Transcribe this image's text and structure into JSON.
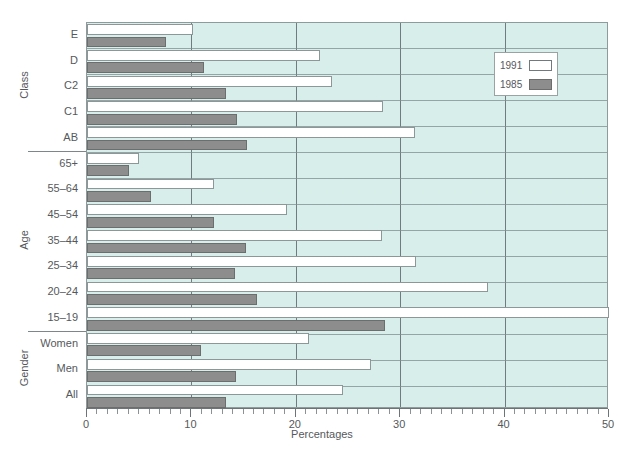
{
  "chart_data": {
    "type": "bar",
    "orientation": "horizontal",
    "title": "",
    "xlabel": "Percentages",
    "ylabel": "",
    "xlim": [
      0,
      50
    ],
    "xticks": [
      0,
      10,
      20,
      30,
      40,
      50
    ],
    "xtick_labels": [
      "0",
      "10",
      "20",
      "30",
      "40",
      "50"
    ],
    "grid": true,
    "legend_position": "upper right",
    "group_labels": [
      "Class",
      "Age",
      "Gender"
    ],
    "categories": [
      "E",
      "D",
      "C2",
      "C1",
      "AB",
      "65+",
      "55–64",
      "45–54",
      "35–44",
      "25–34",
      "20–24",
      "15–19",
      "Women",
      "Men",
      "All"
    ],
    "series": [
      {
        "name": "1991",
        "color": "#ffffff",
        "values": [
          10.2,
          22.3,
          23.5,
          28.4,
          31.4,
          5.0,
          12.2,
          19.2,
          28.3,
          31.5,
          38.4,
          50.0,
          21.3,
          27.2,
          24.5
        ]
      },
      {
        "name": "1985",
        "color": "#8d8d8d",
        "values": [
          7.6,
          11.2,
          13.3,
          14.4,
          15.3,
          4.0,
          6.1,
          12.2,
          15.2,
          14.2,
          16.3,
          28.5,
          10.9,
          14.3,
          13.3
        ]
      }
    ]
  },
  "axis": {
    "x_title": "Percentages",
    "tick_labels": [
      "0",
      "10",
      "20",
      "30",
      "40",
      "50"
    ]
  },
  "legend": {
    "entries": [
      {
        "label": "1991",
        "swatch": "white-swatch"
      },
      {
        "label": "1985",
        "swatch": "grey-swatch"
      }
    ]
  },
  "groups": [
    {
      "label": "Class",
      "categories": [
        "E",
        "D",
        "C2",
        "C1",
        "AB"
      ]
    },
    {
      "label": "Age",
      "categories": [
        "65+",
        "55–64",
        "45–54",
        "35–44",
        "25–34",
        "20–24",
        "15–19"
      ]
    },
    {
      "label": "Gender",
      "categories": [
        "Women",
        "Men",
        "All"
      ]
    }
  ],
  "colors": {
    "plot_background": "#d8eeeb",
    "series_1991": "#ffffff",
    "series_1985": "#8d8d8d",
    "grid": "#6f7d80",
    "text": "#55595c"
  }
}
